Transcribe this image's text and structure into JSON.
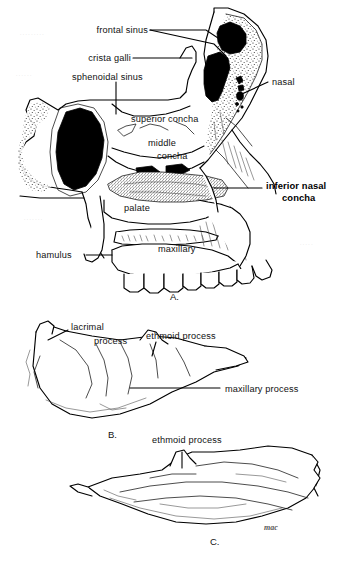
{
  "plate": {
    "title": "Inferior nasal concha — lateral nasal wall and isolated bone",
    "background_color": "#ffffff",
    "ink_color": "#000000",
    "signature": "mac"
  },
  "panels": [
    {
      "id": "A",
      "letter": "A.",
      "caption": "Lateral wall of nasal cavity, sagittal section",
      "labels": [
        {
          "key": "frontal_sinus",
          "text": "frontal sinus",
          "bold": false
        },
        {
          "key": "crista_galli",
          "text": "crista galli",
          "bold": false
        },
        {
          "key": "sphenoidal_sinus",
          "text": "sphenoidal sinus",
          "bold": false
        },
        {
          "key": "nasal",
          "text": "nasal",
          "bold": false
        },
        {
          "key": "superior_concha",
          "text": "superior concha",
          "bold": false
        },
        {
          "key": "middle_concha_1",
          "text": "middle",
          "bold": false
        },
        {
          "key": "middle_concha_2",
          "text": "concha",
          "bold": false
        },
        {
          "key": "inferior_line1",
          "text": "inferior nasal",
          "bold": true
        },
        {
          "key": "inferior_line2",
          "text": "concha",
          "bold": true
        },
        {
          "key": "palate",
          "text": "palate",
          "bold": false
        },
        {
          "key": "maxillary",
          "text": "maxillary",
          "bold": false
        },
        {
          "key": "hamulus",
          "text": "hamulus",
          "bold": false
        }
      ]
    },
    {
      "id": "B",
      "letter": "B.",
      "caption": "Isolated inferior nasal concha, medial surface",
      "labels": [
        {
          "key": "lacrimal_1",
          "text": "lacrimal",
          "bold": false
        },
        {
          "key": "lacrimal_2",
          "text": "process",
          "bold": false
        },
        {
          "key": "ethmoid_b",
          "text": "ethmoid process",
          "bold": false
        },
        {
          "key": "maxillary_proc",
          "text": "maxillary process",
          "bold": false
        }
      ]
    },
    {
      "id": "C",
      "letter": "C.",
      "caption": "Isolated inferior nasal concha, lateral surface",
      "labels": [
        {
          "key": "ethmoid_c",
          "text": "ethmoid process",
          "bold": false
        }
      ]
    }
  ],
  "margin_artifacts": [
    {
      "key": "ghost_1",
      "text": "........."
    },
    {
      "key": "ghost_2",
      "text": "......"
    },
    {
      "key": "ghost_3",
      "text": "......."
    },
    {
      "key": "ghost_4",
      "text": "....."
    }
  ]
}
